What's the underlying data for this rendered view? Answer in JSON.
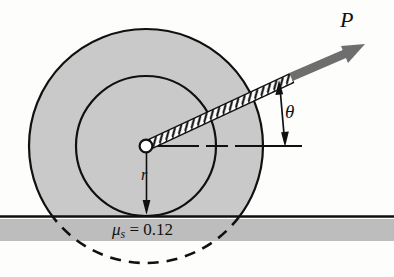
{
  "figure": {
    "type": "physics-free-body-diagram",
    "labels": {
      "force": "P",
      "angle": "θ",
      "radius": "r",
      "friction_symbol": "μ",
      "friction_subscript": "s",
      "friction_equals": " = ",
      "friction_value": "0.12",
      "friction_full": "μₛ = 0.12"
    },
    "colors": {
      "disk_fill": "#c9c9c9",
      "outline": "#101010",
      "ground_band": "#bdbdbd",
      "arrow_gray": "#6e6e6e",
      "background": "#fdfdfc",
      "hub_fill": "#ffffff"
    },
    "geometry": {
      "center_x": 146,
      "center_y": 146,
      "outer_radius": 117,
      "inner_radius": 70,
      "hub_radius": 6,
      "ground_y": 216,
      "ground_band_top": 219,
      "ground_band_height": 22,
      "cord_angle_deg": 25,
      "cord_end_x": 292,
      "cord_end_y": 76,
      "arrow_tip_x": 364,
      "arrow_tip_y": 45
    }
  }
}
